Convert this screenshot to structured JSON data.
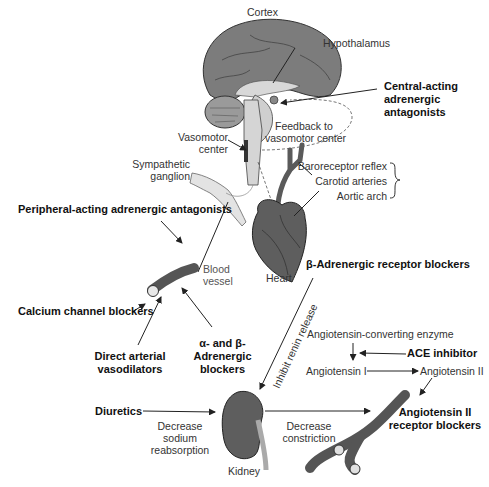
{
  "diagram": {
    "anatomy_labels": {
      "cortex": "Cortex",
      "hypothalamus": "Hypothalamus",
      "vasomotor_center": [
        "Vasomotor",
        "center"
      ],
      "feedback": [
        "Feedback to",
        "vasomotor center"
      ],
      "sympathetic_ganglion": [
        "Sympathetic",
        "ganglion"
      ],
      "baroreceptor_reflex": "Baroreceptor reflex",
      "carotid_arteries": "Carotid arteries",
      "aortic_arch": "Aortic arch",
      "heart": "Heart",
      "blood_vessel": [
        "Blood",
        "vessel"
      ],
      "kidney": "Kidney"
    },
    "drug_classes": {
      "central_acting": [
        "Central-acting",
        "adrenergic",
        "antagonists"
      ],
      "peripheral_acting": "Peripheral-acting adrenergic antagonists",
      "beta_blockers": "β-Adrenergic receptor blockers",
      "calcium_channel": "Calcium channel blockers",
      "direct_vasodilators": [
        "Direct arterial",
        "vasodilators"
      ],
      "alpha_beta_blockers": [
        "α- and β-",
        "Adrenergic",
        "blockers"
      ],
      "ace_inhibitor": "ACE inhibitor",
      "diuretics": "Diuretics",
      "arb": [
        "Angiotensin II",
        "receptor blockers"
      ]
    },
    "process_labels": {
      "inhibit_renin": "Inhibit renin release",
      "ace_enzyme": "Angiotensin-converting enzyme",
      "angiotensin_1": "Angiotensin I",
      "angiotensin_2": "Angiotensin II",
      "decrease_sodium": [
        "Decrease",
        "sodium",
        "reabsorption"
      ],
      "decrease_constriction": [
        "Decrease",
        "constriction"
      ]
    },
    "colors": {
      "organ_dark": "#5a5a5a",
      "organ_mid": "#8a8a8a",
      "organ_light": "#cfcfcf",
      "line": "#222222"
    }
  }
}
